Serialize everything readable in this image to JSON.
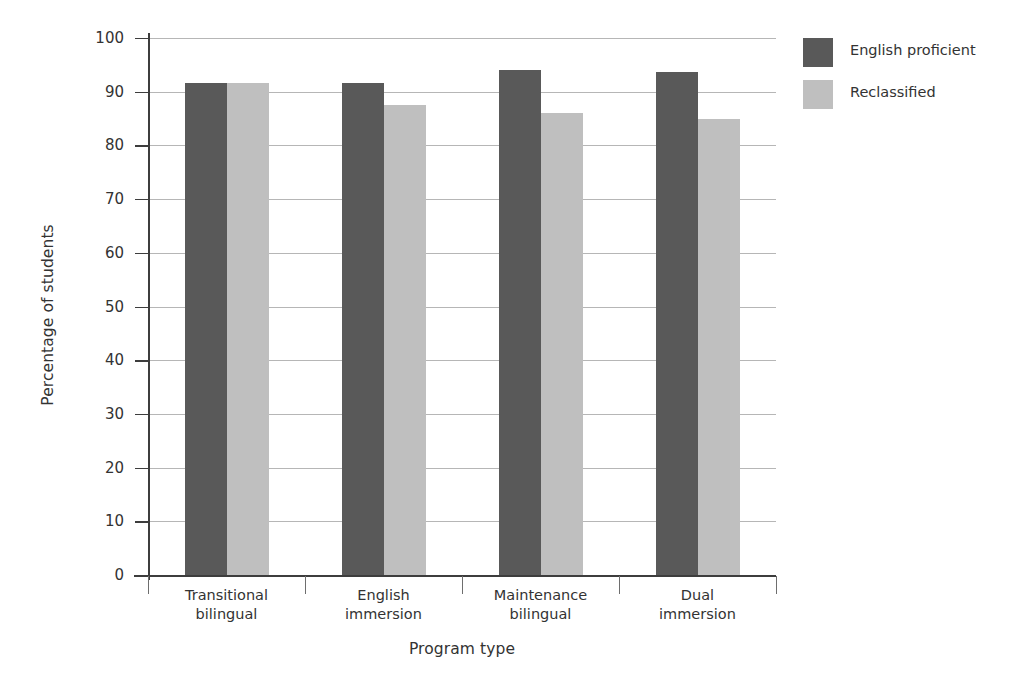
{
  "chart_data": {
    "type": "bar",
    "title": "",
    "subtitle": "",
    "xlabel": "Program type",
    "ylabel": "Percentage of students",
    "categories": [
      "Transitional bilingual",
      "English immersion",
      "Maintenance bilingual",
      "Dual immersion"
    ],
    "category_lines": [
      [
        "Transitional",
        "bilingual"
      ],
      [
        "English",
        "immersion"
      ],
      [
        "Maintenance",
        "bilingual"
      ],
      [
        "Dual",
        "immersion"
      ]
    ],
    "series": [
      {
        "name": "English proficient",
        "color": "#595959",
        "values": [
          91.7,
          91.7,
          94.0,
          93.7
        ]
      },
      {
        "name": "Reclassified",
        "color": "#bfbfbf",
        "values": [
          91.7,
          87.5,
          86.0,
          85.0
        ]
      }
    ],
    "ylim": [
      0,
      100
    ],
    "yticks": [
      0,
      10,
      20,
      30,
      40,
      50,
      60,
      70,
      80,
      90,
      100
    ],
    "ytick_labels": [
      "0",
      "10",
      "20",
      "30",
      "40",
      "50",
      "60",
      "70",
      "80",
      "90",
      "100"
    ],
    "grid": true,
    "grid_axis": "y",
    "legend_position": "right-top",
    "background": "#ffffff",
    "axis_color": "#3d3d3d",
    "grid_color": "#b6b6b6"
  }
}
